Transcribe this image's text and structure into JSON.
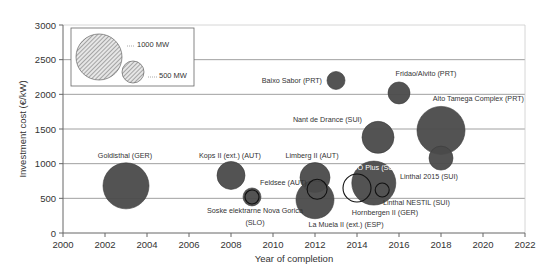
{
  "chart_data": {
    "type": "bubble",
    "title": "",
    "xlabel": "Year of completion",
    "ylabel": "Investment cost (€/kW)",
    "xlim": [
      2000,
      2022
    ],
    "ylim": [
      0,
      3000
    ],
    "xticks": [
      2000,
      2002,
      2004,
      2006,
      2008,
      2010,
      2012,
      2014,
      2016,
      2018,
      2020,
      2022
    ],
    "yticks": [
      0,
      500,
      1000,
      1500,
      2000,
      2500,
      3000
    ],
    "grid": "horizontal",
    "legend": {
      "position": "top-left",
      "entries": [
        {
          "label": "1000 MW",
          "size_mw": 1000
        },
        {
          "label": "500 MW",
          "size_mw": 500
        }
      ]
    },
    "series": [
      {
        "name": "Goldisthal (GER)",
        "x": 2003,
        "y": 680,
        "r": 23,
        "style": "filled"
      },
      {
        "name": "Kops II (ext.) (AUT)",
        "x": 2008,
        "y": 830,
        "r": 14,
        "style": "filled"
      },
      {
        "name": "Feldsee (AUT)",
        "x": 2009,
        "y": 520,
        "r": 9,
        "style": "filled"
      },
      {
        "name": "Soske elektrarne Nova Gorica (SLO)",
        "x": 2009,
        "y": 520,
        "r": 7,
        "style": "outline"
      },
      {
        "name": "Limberg II (AUT)",
        "x": 2012,
        "y": 800,
        "r": 15,
        "style": "filled"
      },
      {
        "name": "La Muela II (ext.) (ESP)",
        "x": 2012,
        "y": 480,
        "r": 19,
        "style": "filled"
      },
      {
        "name": "Limberg II inner",
        "x": 2012.1,
        "y": 630,
        "r": 10,
        "style": "outline"
      },
      {
        "name": "KWO Plus (SUI)",
        "x": 2014.8,
        "y": 720,
        "r": 22,
        "style": "filled"
      },
      {
        "name": "Hornbergen II (GER)",
        "x": 2014,
        "y": 650,
        "r": 14,
        "style": "outline"
      },
      {
        "name": "Linthal NESTIL (SUI)",
        "x": 2015.2,
        "y": 620,
        "r": 7,
        "style": "outline"
      },
      {
        "name": "Nant de Drance (SUI)",
        "x": 2015,
        "y": 1380,
        "r": 16,
        "style": "filled"
      },
      {
        "name": "Baixo Sabor (PRT)",
        "x": 2013,
        "y": 2200,
        "r": 9,
        "style": "filled"
      },
      {
        "name": "Fridao/Alvito (PRT)",
        "x": 2016,
        "y": 2020,
        "r": 11,
        "style": "filled"
      },
      {
        "name": "Alto Tamega Complex (PRT)",
        "x": 2018,
        "y": 1480,
        "r": 24,
        "style": "filled"
      },
      {
        "name": "Linthal 2015 (SUI)",
        "x": 2018,
        "y": 1080,
        "r": 12,
        "style": "filled"
      }
    ],
    "labels": [
      {
        "text": "Goldisthal (GER)",
        "x": 125,
        "y": 158,
        "anchor": "middle"
      },
      {
        "text": "Kops II (ext.) (AUT)",
        "x": 230,
        "y": 158,
        "anchor": "middle"
      },
      {
        "text": "Feldsee (AUT)",
        "x": 260,
        "y": 185,
        "anchor": "start"
      },
      {
        "text": "Soske elektrarne Nova Gorica",
        "x": 255,
        "y": 213,
        "anchor": "middle"
      },
      {
        "text": "(SLO)",
        "x": 255,
        "y": 225,
        "anchor": "middle"
      },
      {
        "text": "Limberg II (AUT)",
        "x": 312,
        "y": 158,
        "anchor": "middle"
      },
      {
        "text": "La Muela II (ext.) (ESP)",
        "x": 346,
        "y": 227,
        "anchor": "middle"
      },
      {
        "text": "KWO Plus (SUI)",
        "x": 346,
        "y": 170,
        "anchor": "start"
      },
      {
        "text": "Hornbergen II (GER)",
        "x": 385,
        "y": 215,
        "anchor": "middle"
      },
      {
        "text": "Linthal NESTIL (SUI)",
        "x": 383,
        "y": 205,
        "anchor": "start"
      },
      {
        "text": "Linthal 2015 (SUI)",
        "x": 400,
        "y": 179,
        "anchor": "start"
      },
      {
        "text": "Nant de Drance (SUI)",
        "x": 362,
        "y": 122,
        "anchor": "end"
      },
      {
        "text": "Baixo Sabor (PRT)",
        "x": 322,
        "y": 83,
        "anchor": "end"
      },
      {
        "text": "Fridao/Alvito (PRT)",
        "x": 426,
        "y": 76,
        "anchor": "middle"
      },
      {
        "text": "Alto Tamega Complex (PRT)",
        "x": 524,
        "y": 101,
        "anchor": "end"
      }
    ]
  },
  "colors": {
    "bubble_fill": "#4a4a4a",
    "bubble_stroke": "#111111",
    "axis": "#666666",
    "grid": "#888888",
    "label_text": "#333333",
    "legend_hatch": "#888888"
  }
}
